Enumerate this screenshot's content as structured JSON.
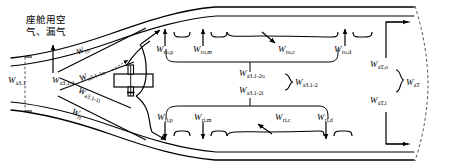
{
  "diagram": {
    "title_cjk": "座舱用空\n气、漏气",
    "title_cjk_line1": "座舱用空",
    "title_cjk_line2": "气、漏气",
    "colors": {
      "line": "#000000",
      "background": "#ffffff",
      "dashed_boundary": "#555555"
    },
    "labels": {
      "inlet_total": {
        "base": "W",
        "sub": "a3.1"
      },
      "stage1": {
        "base": "W",
        "sub": "a3.1-1"
      },
      "stage1_outer": {
        "base": "W",
        "sub": "a3.1-1o"
      },
      "stage1_inner": {
        "base": "W",
        "sub": "a3.1-1i"
      },
      "cabin_outer": {
        "base": "W",
        "sub": "ro"
      },
      "cabin_inner": {
        "base": "W",
        "sub": "ri"
      },
      "outer_p": {
        "base": "W",
        "sub": "ro,p"
      },
      "outer_m": {
        "base": "W",
        "sub": "ro,m"
      },
      "outer_c": {
        "base": "W",
        "sub": "ro,c"
      },
      "outer_d": {
        "base": "W",
        "sub": "ro,d"
      },
      "inner_p": {
        "base": "W",
        "sub": "ri,p"
      },
      "inner_m": {
        "base": "W",
        "sub": "ri,m"
      },
      "inner_c": {
        "base": "W",
        "sub": "ri,c"
      },
      "inner_d": {
        "base": "W",
        "sub": "ri,d"
      },
      "stage2_outer": {
        "base": "W",
        "sub": "a3.1-2o"
      },
      "stage2_inner": {
        "base": "W",
        "sub": "a3.1-2i"
      },
      "stage2_total": {
        "base": "W",
        "sub": "a3.1-2"
      },
      "turbine_outer": {
        "base": "W",
        "sub": "aT,o"
      },
      "turbine_inner": {
        "base": "W",
        "sub": "aT,i"
      },
      "turbine_total": {
        "base": "W",
        "sub": "aT"
      }
    },
    "components": {
      "valve": "valve-symbol"
    }
  }
}
